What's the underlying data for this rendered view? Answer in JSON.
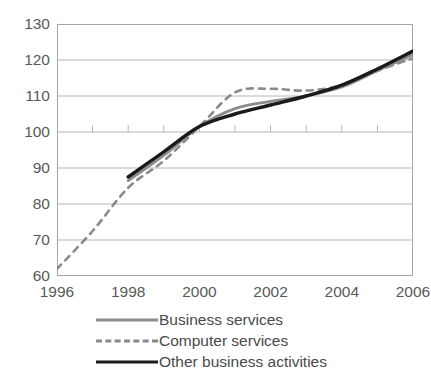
{
  "title": {
    "text": ""
  },
  "axes": {
    "y_ticks": [
      "130",
      "120",
      "110",
      "100",
      "90",
      "80",
      "70",
      "60"
    ],
    "x_ticks": [
      "1996",
      "1998",
      "2000",
      "2002",
      "2004",
      "2006"
    ]
  },
  "legend": {
    "items": [
      {
        "label": "Business services",
        "style": "solid",
        "color": "#8d8d8d"
      },
      {
        "label": "Computer services",
        "style": "dashed",
        "color": "#8a8a8a"
      },
      {
        "label": "Other business activities",
        "style": "solid",
        "color": "#1a1a1a"
      }
    ]
  },
  "colors": {
    "business_services": "#8d8d8d",
    "computer_services": "#8a8a8a",
    "other_business_activities": "#1a1a1a",
    "gridline": "#b5b5b5",
    "frame": "#a6a6a6",
    "text": "#595959"
  },
  "chart_data": {
    "type": "line",
    "title": "",
    "xlabel": "",
    "ylabel": "",
    "xlim": [
      1996,
      2006
    ],
    "ylim": [
      60,
      130
    ],
    "ytick_step": 10,
    "xtick_step": 1,
    "xtick_label_step": 2,
    "grid": "horizontal",
    "legend_position": "bottom",
    "x": [
      1996,
      1997,
      1998,
      1999,
      2000,
      2001,
      2002,
      2003,
      2004,
      2005,
      2006
    ],
    "series": [
      {
        "name": "Business services",
        "style": "solid",
        "color": "#8d8d8d",
        "values": [
          null,
          null,
          86.5,
          93.5,
          101.5,
          106.5,
          108.5,
          110.0,
          112.5,
          117.0,
          121.5
        ]
      },
      {
        "name": "Computer services",
        "style": "dashed",
        "color": "#8a8a8a",
        "values": [
          62.0,
          72.5,
          84.5,
          92.0,
          101.5,
          111.0,
          112.0,
          111.5,
          113.0,
          117.0,
          120.5
        ]
      },
      {
        "name": "Other business activities",
        "style": "solid",
        "color": "#1a1a1a",
        "values": [
          null,
          null,
          87.5,
          94.5,
          101.5,
          105.0,
          107.5,
          110.0,
          113.0,
          117.5,
          122.5
        ]
      }
    ]
  }
}
